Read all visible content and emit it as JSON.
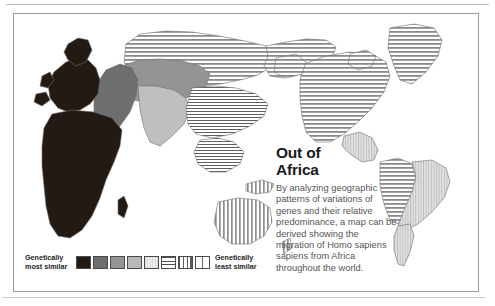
{
  "figure": {
    "name": "out-of-africa-genetic-similarity-map",
    "background_color": "#ffffff",
    "border_color": "#9a9a9a"
  },
  "caption": {
    "title": "Out of\nAfrica",
    "body": "By analyzing geographic patterns of variations of genes and their relative predominance, a map can be derived showing the migration of Homo sapiens sapiens from Africa throughout the world."
  },
  "legend": {
    "label_most_similar": "Genetically\nmost similar",
    "label_least_similar": "Genetically\nleast similar",
    "swatches": [
      {
        "name": "swatch-1-solid-darkest",
        "fill": "#241a14",
        "pattern": "solid"
      },
      {
        "name": "swatch-2-dark-gray",
        "fill": "#6e6e6e",
        "pattern": "solid"
      },
      {
        "name": "swatch-3-mid-gray",
        "fill": "#949494",
        "pattern": "solid"
      },
      {
        "name": "swatch-4-light-gray",
        "fill": "#b9b9b9",
        "pattern": "solid"
      },
      {
        "name": "swatch-5-pale-vertical",
        "fill": "#dcdcdc",
        "pattern": "vertical-fine"
      },
      {
        "name": "swatch-6-horizontal-rule",
        "fill": "#ffffff",
        "pattern": "horizontal"
      },
      {
        "name": "swatch-7-vertical-rule",
        "fill": "#ffffff",
        "pattern": "vertical"
      },
      {
        "name": "swatch-8-white",
        "fill": "#ffffff",
        "pattern": "vertical-wide"
      }
    ]
  },
  "map": {
    "title": "world-map-genetic-distance-from-africa",
    "regions": [
      {
        "name": "africa",
        "shading": "solid-darkest",
        "fill": "#241a14"
      },
      {
        "name": "europe",
        "shading": "solid-darkest",
        "fill": "#241a14"
      },
      {
        "name": "middle-east",
        "shading": "dark-gray",
        "fill": "#6e6e6e"
      },
      {
        "name": "central-asia",
        "shading": "mid-gray",
        "fill": "#949494"
      },
      {
        "name": "south-asia",
        "shading": "light-gray",
        "fill": "#bfbfbf"
      },
      {
        "name": "north-asia",
        "shading": "horizontal-rule",
        "fill": "#ffffff"
      },
      {
        "name": "east-asia",
        "shading": "horizontal-rule",
        "fill": "#ffffff"
      },
      {
        "name": "southeast-asia",
        "shading": "horizontal-rule",
        "fill": "#ffffff"
      },
      {
        "name": "australia",
        "shading": "vertical-rule",
        "fill": "#ffffff"
      },
      {
        "name": "new-guinea",
        "shading": "vertical-rule",
        "fill": "#ffffff"
      },
      {
        "name": "greenland",
        "shading": "horizontal-rule",
        "fill": "#ffffff"
      },
      {
        "name": "north-america",
        "shading": "horizontal-rule",
        "fill": "#ffffff"
      },
      {
        "name": "central-america",
        "shading": "pale-vertical",
        "fill": "#dcdcdc"
      },
      {
        "name": "south-america-west",
        "shading": "horizontal-rule",
        "fill": "#ffffff"
      },
      {
        "name": "south-america-east",
        "shading": "pale-vertical",
        "fill": "#dcdcdc"
      }
    ]
  }
}
